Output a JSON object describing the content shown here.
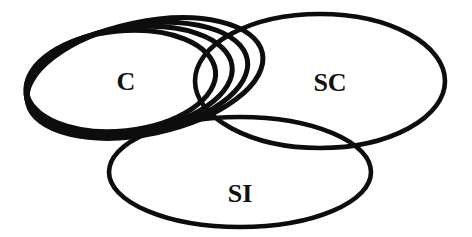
{
  "figure": {
    "background_color": "#ffffff",
    "stroke_color": "#0d0d0d",
    "label_color": "#111111",
    "width": 472,
    "height": 237
  },
  "labels": {
    "c": "C",
    "sc": "SC",
    "si": "SI"
  },
  "chart_data": {
    "type": "diagram",
    "diagram_kind": "venn",
    "title": "",
    "grid": false,
    "legend_position": "none",
    "background_color": "#ffffff",
    "stroke_color": "#0d0d0d",
    "label_color": "#111111",
    "set_labels": [
      "C",
      "SC",
      "SI"
    ],
    "set_count": 3,
    "nested_c_ellipse_count": 4,
    "ellipses": [
      {
        "id": "c-1",
        "group": "C",
        "cx": 121,
        "cy": 81,
        "rx": 95,
        "ry": 50,
        "rotation": -6,
        "stroke_width": 5.0
      },
      {
        "id": "c-2",
        "group": "C",
        "cx": 129,
        "cy": 80,
        "rx": 104,
        "ry": 52,
        "rotation": -8,
        "stroke_width": 5.0
      },
      {
        "id": "c-3",
        "group": "C",
        "cx": 137,
        "cy": 79,
        "rx": 112,
        "ry": 54,
        "rotation": -10,
        "stroke_width": 5.0
      },
      {
        "id": "c-4",
        "group": "C",
        "cx": 145,
        "cy": 78,
        "rx": 120,
        "ry": 56,
        "rotation": -12,
        "stroke_width": 5.0
      },
      {
        "id": "sc-1",
        "group": "SC",
        "cx": 320,
        "cy": 81,
        "rx": 125,
        "ry": 67,
        "rotation": 0,
        "stroke_width": 4.6
      },
      {
        "id": "si-1",
        "group": "SI",
        "cx": 240,
        "cy": 172,
        "rx": 131,
        "ry": 55,
        "rotation": 0,
        "stroke_width": 4.6
      }
    ],
    "label_positions": [
      {
        "text": "C",
        "x": 126,
        "y": 84,
        "font_size": 26
      },
      {
        "text": "SC",
        "x": 330,
        "y": 85,
        "font_size": 26
      },
      {
        "text": "SI",
        "x": 240,
        "y": 196,
        "font_size": 26
      }
    ]
  }
}
